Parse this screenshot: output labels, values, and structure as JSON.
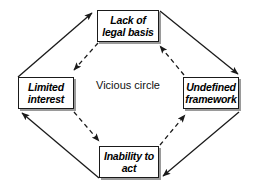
{
  "diagram": {
    "title": "Vicious circle",
    "center": {
      "label": "Vicious circle"
    },
    "nodes": [
      {
        "id": "lack-of-legal-basis",
        "label": "Lack of legal basis",
        "position": "top"
      },
      {
        "id": "limited-interest",
        "label": "Limited interest",
        "position": "left"
      },
      {
        "id": "undefined-framework",
        "label": "Undefined framework",
        "position": "right"
      },
      {
        "id": "inability-to-act",
        "label": "Inability to act",
        "position": "bottom"
      }
    ],
    "edges": [
      {
        "from": "limited-interest",
        "to": "lack-of-legal-basis",
        "style": "solid",
        "path": "outer",
        "direction": "clockwise"
      },
      {
        "from": "lack-of-legal-basis",
        "to": "undefined-framework",
        "style": "solid",
        "path": "outer",
        "direction": "clockwise"
      },
      {
        "from": "undefined-framework",
        "to": "inability-to-act",
        "style": "solid",
        "path": "outer",
        "direction": "clockwise"
      },
      {
        "from": "inability-to-act",
        "to": "limited-interest",
        "style": "solid",
        "path": "outer",
        "direction": "clockwise"
      },
      {
        "from": "lack-of-legal-basis",
        "to": "limited-interest",
        "style": "dashed",
        "path": "inner",
        "direction": "counterclockwise"
      },
      {
        "from": "limited-interest",
        "to": "inability-to-act",
        "style": "dashed",
        "path": "inner",
        "direction": "counterclockwise"
      },
      {
        "from": "inability-to-act",
        "to": "undefined-framework",
        "style": "dashed",
        "path": "inner",
        "direction": "counterclockwise"
      },
      {
        "from": "undefined-framework",
        "to": "lack-of-legal-basis",
        "style": "dashed",
        "path": "inner",
        "direction": "counterclockwise"
      }
    ],
    "colors": {
      "background": "#ffffff",
      "box_fill": "#ffffff",
      "box_border": "#1a1a1a",
      "box_shadow": "#9a9a9a",
      "arrow": "#1a1a1a",
      "text": "#000000"
    }
  }
}
